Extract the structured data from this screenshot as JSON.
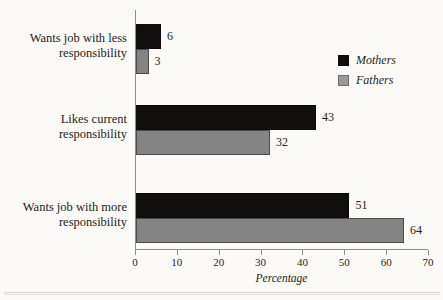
{
  "chart_data": {
    "type": "bar",
    "orientation": "horizontal",
    "title": "",
    "subtitle": "",
    "xlabel": "Percentage",
    "ylabel": "",
    "xlim": [
      0,
      70
    ],
    "xticks": [
      0,
      10,
      20,
      30,
      40,
      50,
      60,
      70
    ],
    "xtick_labels": [
      "0",
      "10",
      "20",
      "30",
      "40",
      "50",
      "60",
      "70"
    ],
    "grid": false,
    "legend_position": "top-right",
    "categories": [
      "Wants job with less responsibility",
      "Likes current responsibility",
      "Wants job with more responsibility"
    ],
    "category_lines": [
      [
        "Wants job with less",
        "responsibility"
      ],
      [
        "Likes current",
        "responsibility"
      ],
      [
        "Wants job with more",
        "responsibility"
      ]
    ],
    "series": [
      {
        "name": "Mothers",
        "color": "#100f0d",
        "values": [
          6,
          43,
          51
        ]
      },
      {
        "name": "Fathers",
        "color": "#848484",
        "values": [
          3,
          32,
          64
        ]
      }
    ],
    "data_labels": {
      "Wants job with less responsibility": {
        "Mothers": "6",
        "Fathers": "3"
      },
      "Likes current responsibility": {
        "Mothers": "43",
        "Fathers": "32"
      },
      "Wants job with more responsibility": {
        "Mothers": "51",
        "Fathers": "64"
      }
    }
  },
  "legend": {
    "items": [
      {
        "label": "Mothers",
        "swatch": "black-square-swatch"
      },
      {
        "label": "Fathers",
        "swatch": "gray-square-swatch"
      }
    ]
  },
  "axis": {
    "x_title": "Percentage",
    "ticks": [
      "0",
      "10",
      "20",
      "30",
      "40",
      "50",
      "60",
      "70"
    ]
  },
  "bars": [
    {
      "group": 0,
      "series": "Mothers",
      "value": 6,
      "label": "6"
    },
    {
      "group": 0,
      "series": "Fathers",
      "value": 3,
      "label": "3"
    },
    {
      "group": 1,
      "series": "Mothers",
      "value": 43,
      "label": "43"
    },
    {
      "group": 1,
      "series": "Fathers",
      "value": 32,
      "label": "32"
    },
    {
      "group": 2,
      "series": "Mothers",
      "value": 51,
      "label": "51"
    },
    {
      "group": 2,
      "series": "Fathers",
      "value": 64,
      "label": "64"
    }
  ],
  "colors": {
    "mothers": "#100f0d",
    "fathers": "#848484",
    "axis": "#8e8e8e",
    "background": "#fbfaf7",
    "text": "#1d1d1d"
  }
}
